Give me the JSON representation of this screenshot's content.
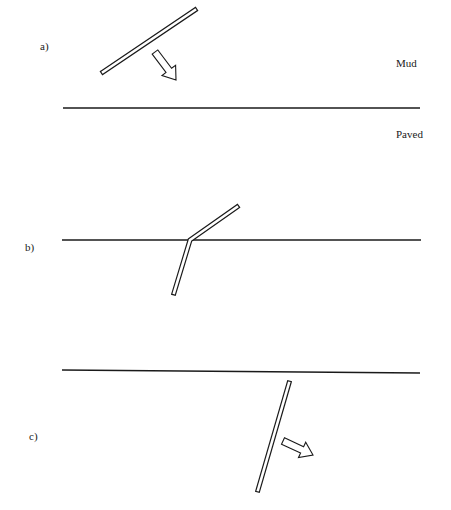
{
  "panels": [
    {
      "id": "a",
      "label": "a)",
      "label_pos": [
        40,
        40
      ],
      "boundary": {
        "x1": 63,
        "y1": 108,
        "x2": 420,
        "y2": 108
      },
      "regions": [
        {
          "name": "Mud",
          "pos": [
            396,
            57
          ]
        },
        {
          "name": "Paved",
          "pos": [
            396,
            128
          ]
        }
      ],
      "rod": {
        "points": [
          [
            103,
            72
          ],
          [
            195,
            10
          ]
        ]
      },
      "arrow": {
        "from": [
          155,
          52
        ],
        "to": [
          176,
          80
        ]
      }
    },
    {
      "id": "b",
      "label": "b)",
      "label_pos": [
        25,
        241
      ],
      "boundary": {
        "x1": 62,
        "y1": 240,
        "x2": 421,
        "y2": 240
      },
      "rod": {
        "points": [
          [
            237,
            207
          ],
          [
            190,
            240
          ],
          [
            174,
            293
          ]
        ]
      }
    },
    {
      "id": "c",
      "label": "c)",
      "label_pos": [
        29,
        430
      ],
      "boundary": {
        "x1": 62,
        "y1": 370,
        "x2": 420,
        "y2": 373
      },
      "rod": {
        "points": [
          [
            289,
            383
          ],
          [
            258,
            490
          ]
        ]
      },
      "arrow": {
        "from": [
          283,
          441
        ],
        "to": [
          313,
          455
        ]
      }
    }
  ],
  "colors": {
    "stroke": "#1a1a1a",
    "fill": "#ffffff"
  }
}
